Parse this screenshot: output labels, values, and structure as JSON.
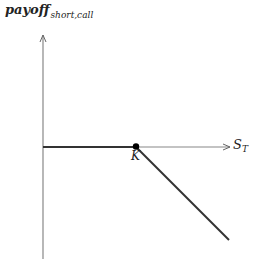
{
  "diagram": {
    "y_axis": {
      "label_main": "payoff",
      "label_sub": "short,call"
    },
    "x_axis": {
      "label_main": "S",
      "label_sub": "T"
    },
    "strike": {
      "label": "K"
    },
    "colors": {
      "axis": "#888888",
      "payoff_line": "#333333",
      "dot": "#000000",
      "text": "#222222"
    }
  }
}
